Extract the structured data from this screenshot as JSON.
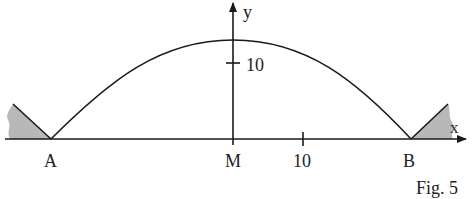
{
  "figure": {
    "caption": "Fig. 5",
    "labels": {
      "A": "A",
      "M": "M",
      "B": "B",
      "x_axis": "x",
      "y_axis": "y",
      "x_tick": "10",
      "y_tick": "10"
    },
    "colors": {
      "stroke": "#1a1a1a",
      "support_fill": "#b8b8b8"
    }
  }
}
